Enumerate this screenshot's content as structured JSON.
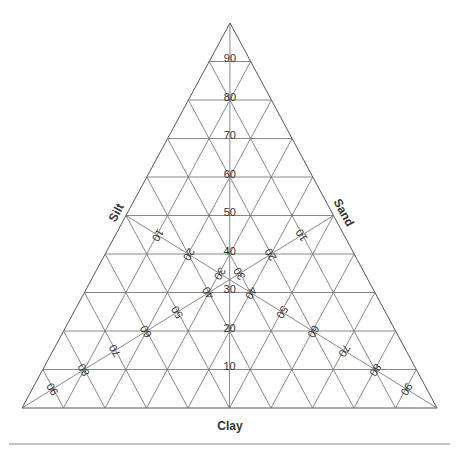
{
  "diagram": {
    "type": "ternary-soil-texture",
    "vertices": {
      "apex": [
        230,
        23
      ],
      "left": [
        22,
        408
      ],
      "right": [
        437,
        408
      ]
    },
    "divisions": 10,
    "axes": {
      "clay": {
        "label": "Clay",
        "position": [
          230,
          427
        ],
        "rotation": 0
      },
      "silt": {
        "label": "Silt",
        "position": [
          117,
          213
        ],
        "rotation": -61.6
      },
      "sand": {
        "label": "Sand",
        "position": [
          343,
          213
        ],
        "rotation": 61.6
      }
    },
    "vertical_ticks": [
      "10",
      "20",
      "30",
      "40",
      "50",
      "60",
      "70",
      "80",
      "90"
    ],
    "silt_line_ticks": [
      "10",
      "20",
      "30",
      "40",
      "50",
      "60",
      "70",
      "80",
      "90"
    ],
    "sand_line_ticks": [
      "10",
      "20",
      "30",
      "40",
      "50",
      "60",
      "70",
      "80",
      "90"
    ],
    "silt_line_label_rotation": 122,
    "sand_line_label_rotation": -122,
    "separator": {
      "x1": 9,
      "x2": 450,
      "y": 444
    },
    "colors": {
      "grid": "#6a6a6a",
      "text": "#333333",
      "background": "#ffffff"
    }
  }
}
